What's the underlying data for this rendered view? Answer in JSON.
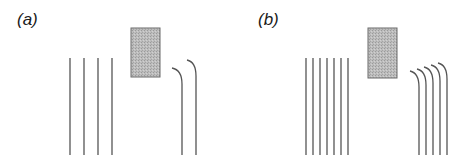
{
  "panels": [
    {
      "label": "(a)",
      "label_pos": [
        17,
        12
      ],
      "obstacle": {
        "x": 131,
        "y": 28,
        "w": 29,
        "h": 49
      },
      "straight_lines_x": [
        70,
        84,
        98,
        112
      ],
      "straight_y": [
        58,
        155
      ],
      "curved_lines": [
        {
          "x_end": 182,
          "start": [
            172,
            68
          ]
        },
        {
          "x_end": 196,
          "start": [
            187,
            60
          ]
        }
      ]
    },
    {
      "label": "(b)",
      "label_pos": [
        258,
        12
      ],
      "obstacle": {
        "x": 368,
        "y": 28,
        "w": 29,
        "h": 50
      },
      "straight_lines_x": [
        306,
        313,
        320,
        327,
        334,
        341,
        348
      ],
      "straight_y": [
        58,
        155
      ],
      "curved_lines": [
        {
          "x_end": 419,
          "start": [
            410,
            71
          ]
        },
        {
          "x_end": 426,
          "start": [
            417,
            69
          ]
        },
        {
          "x_end": 433,
          "start": [
            424,
            67
          ]
        },
        {
          "x_end": 440,
          "start": [
            431,
            65
          ]
        },
        {
          "x_end": 447,
          "start": [
            438,
            63
          ]
        }
      ]
    }
  ],
  "colors": {
    "line": "#555555",
    "obstacle_fill": "#b8b8b8",
    "obstacle_stroke": "#6a6a6a"
  }
}
